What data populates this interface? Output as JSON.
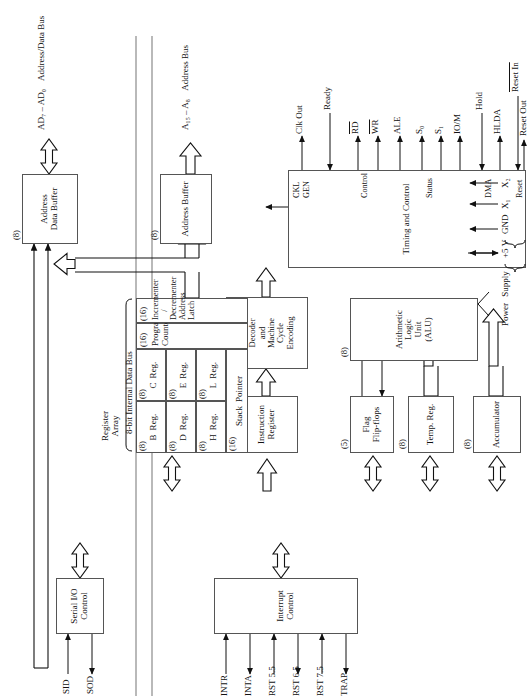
{
  "diagram": {
    "orientation": "rotated-90-ccw"
  },
  "bus": {
    "internal_data_bus": "8-bit Internal Data Bus"
  },
  "blocks": {
    "serial_io": {
      "size": "",
      "line1": "Serial I/O",
      "line2": "Control"
    },
    "interrupt_control": {
      "line1": "Interrupt Control"
    },
    "accumulator": {
      "size": "(8)",
      "line1": "Accumulator"
    },
    "temp_reg": {
      "size": "(8)",
      "line1": "Temp. Reg."
    },
    "flag_flipflops": {
      "size": "(5)",
      "line1": "Flag",
      "line2": "Flip-flops"
    },
    "alu": {
      "size": "(8)",
      "line1": "Arithmetic",
      "line2": "Logic",
      "line3": "Unit",
      "line4": "(ALU)"
    },
    "instruction_register": {
      "size": "(8)",
      "line1": "Instruction",
      "line2": "Register"
    },
    "instruction_decoder": {
      "line1": "Instruction",
      "line2": "Decoder",
      "line3": "and",
      "line4": "Machine",
      "line5": "Cycle",
      "line6": "Encoding"
    },
    "timing_control": {
      "line1": "Timing and Control"
    },
    "address_buffer": {
      "size": "(8)",
      "line1": "Address Buffer"
    },
    "address_data_buffer": {
      "size": "(8)",
      "line1": "Address",
      "line2": "Data Buffer"
    }
  },
  "register_array": {
    "title_line1": "Register",
    "title_line2": "Array",
    "cells": [
      {
        "size": "(8)",
        "label": "B",
        "label2": "Reg."
      },
      {
        "size": "(8)",
        "label": "C",
        "label2": "Reg."
      },
      {
        "size": "(8)",
        "label": "D",
        "label2": "Reg."
      },
      {
        "size": "(8)",
        "label": "E",
        "label2": "Reg."
      },
      {
        "size": "(8)",
        "label": "H",
        "label2": "Reg."
      },
      {
        "size": "(8)",
        "label": "L",
        "label2": "Reg."
      },
      {
        "size": "(16)",
        "label": "Stack",
        "label2": "Pointer"
      },
      {
        "size": "(16)",
        "label": "Program",
        "label2": "Counter"
      },
      {
        "size": "(16)",
        "label": "Incrementer /",
        "label2": "Decrementer",
        "label3": "Address Latch"
      }
    ]
  },
  "serial_pins": {
    "sid": "SID",
    "sod": "SOD"
  },
  "interrupt_pins": {
    "inputs": [
      "INTR",
      "RST 5.5",
      "RST 6.5",
      "RST 7.5",
      "TRAP"
    ],
    "outputs": [
      "INTA"
    ],
    "all_in_order": [
      "INTR",
      "INTA",
      "RST 5.5",
      "RST 6.5",
      "RST 7.5",
      "TRAP"
    ]
  },
  "timing_groups": {
    "clk_gen": {
      "line1": "CKL",
      "line2": "GEN"
    },
    "control": "Control",
    "status": "Status",
    "dma": "DMA",
    "reset": "Reset"
  },
  "timing_pins": {
    "clk_out": "Clk Out",
    "ready": "Ready",
    "rd": "RD",
    "wr": "WR",
    "ale": "ALE",
    "s0": "S0",
    "s1": "S1",
    "io_m": "IO/M",
    "hold": "Hold",
    "hlda": "HLDA",
    "reset_in": "Reset In",
    "reset_out": "Reset Out"
  },
  "power_supply": {
    "label_line1": "Power",
    "label_line2": "Supply",
    "pins": [
      "+5 V",
      "GND",
      "X1",
      "X2"
    ]
  },
  "external_buses": {
    "address_data": {
      "pins": "AD7 – AD0",
      "name": "Address/Data Bus"
    },
    "address": {
      "pins": "A15 – A8",
      "name": "Address Bus"
    }
  },
  "colors": {
    "line": "#111111",
    "box_border": "#555555",
    "rail": "#8a8a8a",
    "bg": "#ffffff"
  }
}
